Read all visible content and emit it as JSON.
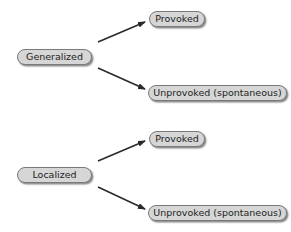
{
  "diagram": {
    "groups": [
      {
        "root": "Generalized",
        "children": [
          "Provoked",
          "Unprovoked (spontaneous)"
        ]
      },
      {
        "root": "Localized",
        "children": [
          "Provoked",
          "Unprovoked (spontaneous)"
        ]
      }
    ],
    "colors": {
      "node_fill": "#d6d6d6",
      "node_border": "#7a7a7a",
      "arrow": "#2a2a2a",
      "text": "#222222"
    }
  }
}
